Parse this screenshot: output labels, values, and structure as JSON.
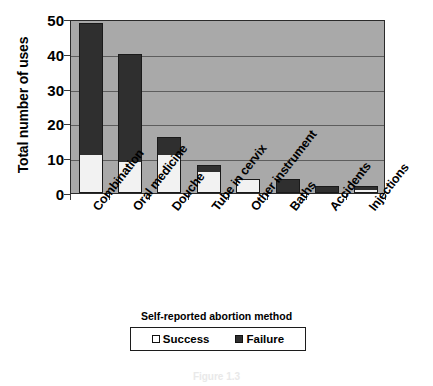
{
  "chart_data": {
    "type": "bar",
    "subtype": "stacked-bar",
    "title": "",
    "xlabel": "",
    "ylabel": "Total number of uses",
    "ylim": [
      0,
      50
    ],
    "ytick_labels": [
      "0",
      "10",
      "20",
      "30",
      "40",
      "50"
    ],
    "ytick_values": [
      0,
      10,
      20,
      30,
      40,
      50
    ],
    "grid": true,
    "grid_axis": "y",
    "legend_position": "bottom",
    "legend_title": "Self-reported abortion method",
    "categories": [
      "Combination",
      "Oral medicine",
      "Douche",
      "Tube in cervix",
      "Other instrument",
      "Baths",
      "Accidents",
      "Injections"
    ],
    "series": [
      {
        "name": "Success",
        "color": "#f2f2f2",
        "values": [
          11,
          9,
          11,
          6,
          4,
          0,
          0,
          1
        ]
      },
      {
        "name": "Failure",
        "color": "#2f2f2f",
        "values": [
          38,
          31,
          5,
          2,
          0,
          4,
          2,
          1
        ]
      }
    ],
    "totals": [
      49,
      40,
      16,
      8,
      4,
      4,
      2,
      2
    ],
    "plot_background": "#a9a9a9",
    "gridline_color": "#5d5d5d",
    "axis_color": "#2b2b2b"
  },
  "axis": {
    "y_title": "Total number of uses"
  },
  "legend": {
    "title": "Self-reported abortion method",
    "items": [
      {
        "label": "Success",
        "swatch": "open-square"
      },
      {
        "label": "Failure",
        "swatch": "filled-square"
      }
    ]
  },
  "caption": {
    "text": "Figure 1.3"
  }
}
